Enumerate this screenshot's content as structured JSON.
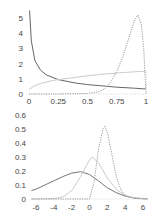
{
  "chart_data": [
    {
      "type": "line",
      "title": "",
      "xlabel": "",
      "ylabel": "",
      "xlim": [
        0,
        1
      ],
      "ylim": [
        0,
        5.4
      ],
      "grid": false,
      "legend": null,
      "x_ticks": [
        "0",
        "0.25",
        "0.5",
        "0.75",
        "1"
      ],
      "y_ticks": [
        "0",
        "1",
        "2",
        "3",
        "4",
        "5"
      ],
      "series": [
        {
          "name": "decreasing (dark solid)",
          "style": "solid",
          "color": "#666666",
          "x": [
            0.005,
            0.02,
            0.05,
            0.1,
            0.15,
            0.25,
            0.4,
            0.5,
            0.6,
            0.75,
            0.9,
            1.0
          ],
          "y": [
            5.5,
            3.5,
            2.2,
            1.55,
            1.25,
            0.95,
            0.72,
            0.62,
            0.55,
            0.45,
            0.38,
            0.33
          ]
        },
        {
          "name": "slowly increasing (light solid)",
          "style": "solid",
          "color": "#cccccc",
          "x": [
            0.0,
            0.05,
            0.1,
            0.2,
            0.25,
            0.4,
            0.5,
            0.6,
            0.75,
            0.9,
            1.0
          ],
          "y": [
            0.3,
            0.55,
            0.7,
            0.88,
            0.95,
            1.1,
            1.2,
            1.28,
            1.38,
            1.46,
            1.5
          ]
        },
        {
          "name": "sharp peak near 0.92 (dotted)",
          "style": "dotted",
          "color": "#999999",
          "x": [
            0.0,
            0.25,
            0.5,
            0.6,
            0.65,
            0.7,
            0.75,
            0.8,
            0.85,
            0.9,
            0.93,
            0.96,
            0.98,
            1.0
          ],
          "y": [
            0.0,
            0.0,
            0.03,
            0.15,
            0.35,
            0.8,
            1.5,
            2.4,
            3.6,
            4.8,
            5.2,
            4.6,
            3.0,
            0.0
          ]
        }
      ]
    },
    {
      "type": "line",
      "title": "",
      "xlabel": "",
      "ylabel": "",
      "xlim": [
        -6.5,
        6.5
      ],
      "ylim": [
        0,
        0.6
      ],
      "grid": false,
      "legend": null,
      "x_ticks": [
        "-6",
        "-4",
        "-2",
        "0",
        "2",
        "4",
        "6"
      ],
      "y_ticks": [
        "0",
        "0.1",
        "0.2",
        "0.3",
        "0.4",
        "0.5",
        "0.6"
      ],
      "series": [
        {
          "name": "wide curve peak at -1 (dark solid)",
          "style": "solid",
          "color": "#777777",
          "x": [
            -6.5,
            -6,
            -5,
            -4,
            -3,
            -2,
            -1,
            0,
            1,
            2,
            3,
            4,
            5,
            6,
            6.5
          ],
          "y": [
            0.06,
            0.07,
            0.1,
            0.13,
            0.16,
            0.185,
            0.195,
            0.175,
            0.13,
            0.08,
            0.045,
            0.02,
            0.008,
            0.003,
            0.001
          ]
        },
        {
          "name": "medium curve peak at 0.3 (light solid)",
          "style": "solid",
          "color": "#cccccc",
          "x": [
            -6.5,
            -4,
            -3,
            -2,
            -1,
            0,
            0.3,
            1,
            2,
            3,
            4,
            5,
            6,
            6.5
          ],
          "y": [
            0.0,
            0.003,
            0.015,
            0.06,
            0.16,
            0.28,
            0.3,
            0.26,
            0.15,
            0.07,
            0.025,
            0.008,
            0.002,
            0.0
          ]
        },
        {
          "name": "narrow curve peak at 1.7 (dotted)",
          "style": "dotted",
          "color": "#999999",
          "x": [
            -6.5,
            -1,
            0,
            0.5,
            1,
            1.5,
            1.7,
            2,
            2.5,
            3,
            3.5,
            4,
            5,
            6,
            6.5
          ],
          "y": [
            0.0,
            0.0,
            0.0,
            0.12,
            0.35,
            0.5,
            0.52,
            0.48,
            0.32,
            0.16,
            0.07,
            0.025,
            0.004,
            0.001,
            0.0
          ]
        }
      ]
    }
  ]
}
